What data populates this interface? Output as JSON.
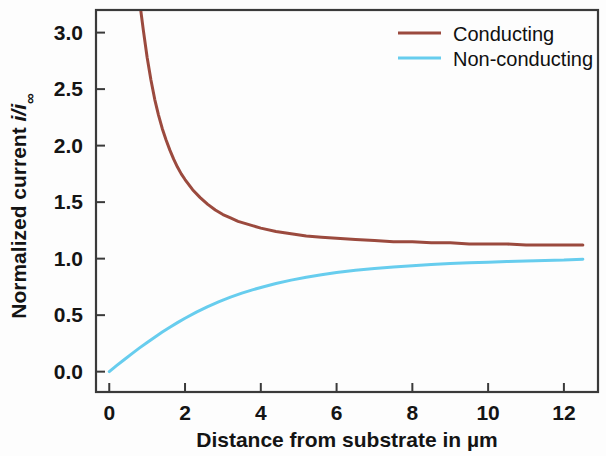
{
  "chart_data": {
    "type": "line",
    "title": "",
    "subtitle": "",
    "xlabel": "Distance from substrate in µm",
    "ylabel": "Normalized current i/i∞",
    "ylabel_parts": {
      "prefix": "Normalized current ",
      "italic_symbol": "i/i",
      "subscript": "∞"
    },
    "xlim": [
      -0.35,
      12.9
    ],
    "ylim": [
      -0.18,
      3.2
    ],
    "xticks": [
      0,
      2,
      4,
      6,
      8,
      10,
      12
    ],
    "xticklabels": [
      "0",
      "2",
      "4",
      "6",
      "8",
      "10",
      "12"
    ],
    "yticks": [
      0.0,
      0.5,
      1.0,
      1.5,
      2.0,
      2.5,
      3.0
    ],
    "yticklabels": [
      "0.0",
      "0.5",
      "1.0",
      "1.5",
      "2.0",
      "2.5",
      "3.0"
    ],
    "grid": false,
    "legend_position": "top-right",
    "frame": "box",
    "series": [
      {
        "name": "Conducting",
        "color": "#9B4A3E",
        "x": [
          0.83,
          0.9,
          1.0,
          1.1,
          1.2,
          1.3,
          1.4,
          1.5,
          1.6,
          1.7,
          1.8,
          1.9,
          2.0,
          2.2,
          2.4,
          2.6,
          2.8,
          3.0,
          3.2,
          3.4,
          3.6,
          3.8,
          4.0,
          4.4,
          4.8,
          5.2,
          5.6,
          6.0,
          6.5,
          7.0,
          7.5,
          8.0,
          8.5,
          9.0,
          9.5,
          10.0,
          10.5,
          11.0,
          11.5,
          12.0,
          12.5
        ],
        "y": [
          3.2,
          3.02,
          2.78,
          2.58,
          2.41,
          2.27,
          2.15,
          2.05,
          1.96,
          1.88,
          1.81,
          1.75,
          1.7,
          1.61,
          1.54,
          1.48,
          1.43,
          1.39,
          1.36,
          1.33,
          1.31,
          1.29,
          1.27,
          1.24,
          1.22,
          1.2,
          1.19,
          1.18,
          1.17,
          1.16,
          1.15,
          1.15,
          1.14,
          1.14,
          1.13,
          1.13,
          1.13,
          1.12,
          1.12,
          1.12,
          1.12
        ]
      },
      {
        "name": "Non-conducting",
        "color": "#67CDEE",
        "x": [
          0.0,
          0.2,
          0.4,
          0.6,
          0.8,
          1.0,
          1.2,
          1.4,
          1.6,
          1.8,
          2.0,
          2.3,
          2.6,
          2.9,
          3.2,
          3.5,
          3.8,
          4.1,
          4.4,
          4.8,
          5.2,
          5.6,
          6.0,
          6.5,
          7.0,
          7.5,
          8.0,
          8.5,
          9.0,
          9.5,
          10.0,
          10.5,
          11.0,
          11.5,
          12.0,
          12.5
        ],
        "y": [
          0.0,
          0.055,
          0.108,
          0.16,
          0.21,
          0.258,
          0.305,
          0.35,
          0.393,
          0.434,
          0.473,
          0.527,
          0.576,
          0.62,
          0.66,
          0.695,
          0.726,
          0.754,
          0.78,
          0.81,
          0.836,
          0.858,
          0.877,
          0.897,
          0.913,
          0.927,
          0.938,
          0.948,
          0.956,
          0.963,
          0.969,
          0.974,
          0.979,
          0.983,
          0.987,
          0.995
        ]
      }
    ]
  },
  "legend": {
    "items": [
      {
        "label": "Conducting",
        "color": "#9B4A3E"
      },
      {
        "label": "Non-conducting",
        "color": "#67CDEE"
      }
    ]
  },
  "axes": {
    "x_title": "Distance from substrate in µm",
    "y_title_prefix": "Normalized current ",
    "y_title_symbol": "i/i",
    "y_title_sub": "∞",
    "x_tick_0": "0",
    "x_tick_1": "2",
    "x_tick_2": "4",
    "x_tick_3": "6",
    "x_tick_4": "8",
    "x_tick_5": "10",
    "x_tick_6": "12",
    "y_tick_0": "0.0",
    "y_tick_1": "0.5",
    "y_tick_2": "1.0",
    "y_tick_3": "1.5",
    "y_tick_4": "2.0",
    "y_tick_5": "2.5",
    "y_tick_6": "3.0"
  },
  "colors": {
    "conducting": "#9B4A3E",
    "non_conducting": "#67CDEE",
    "axis": "#3a3a3a",
    "text": "#141414",
    "background": "#fdfdfd"
  }
}
